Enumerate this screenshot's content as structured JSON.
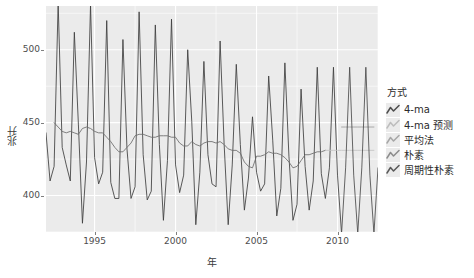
{
  "chart_data": {
    "type": "line",
    "title": "",
    "xlabel": "年",
    "ylabel": "兆升",
    "xlim": [
      1992.0,
      2012.5
    ],
    "ylim": [
      375,
      530
    ],
    "xticks": [
      1995,
      2000,
      2005,
      2010
    ],
    "yticks": [
      400,
      450,
      500
    ],
    "grid": true,
    "legend": {
      "title": "方式",
      "position": "right",
      "entries": [
        {
          "label": "4-ma",
          "color": "#4d4d4d"
        },
        {
          "label": "4-ma 预测",
          "color": "#bdbdbd"
        },
        {
          "label": "平均法",
          "color": "#a6a6a6"
        },
        {
          "label": "朴素",
          "color": "#8c8c8c"
        },
        {
          "label": "周期性朴素",
          "color": "#595959"
        }
      ]
    },
    "series": [
      {
        "name": "观测值",
        "color": "#3d3d3d",
        "type": "line",
        "points": [
          [
            1992.0,
            443
          ],
          [
            1992.25,
            410
          ],
          [
            1992.5,
            420
          ],
          [
            1992.75,
            532
          ],
          [
            1993.0,
            433
          ],
          [
            1993.25,
            421
          ],
          [
            1993.5,
            410
          ],
          [
            1993.75,
            512
          ],
          [
            1994.0,
            449
          ],
          [
            1994.25,
            381
          ],
          [
            1994.5,
            423
          ],
          [
            1994.75,
            531
          ],
          [
            1995.0,
            426
          ],
          [
            1995.25,
            408
          ],
          [
            1995.5,
            416
          ],
          [
            1995.75,
            520
          ],
          [
            1996.0,
            409
          ],
          [
            1996.25,
            398
          ],
          [
            1996.5,
            398
          ],
          [
            1996.75,
            507
          ],
          [
            1997.0,
            432
          ],
          [
            1997.25,
            398
          ],
          [
            1997.5,
            406
          ],
          [
            1997.75,
            526
          ],
          [
            1998.0,
            428
          ],
          [
            1998.25,
            397
          ],
          [
            1998.5,
            403
          ],
          [
            1998.75,
            517
          ],
          [
            1999.0,
            435
          ],
          [
            1999.25,
            383
          ],
          [
            1999.5,
            424
          ],
          [
            1999.75,
            521
          ],
          [
            2000.0,
            421
          ],
          [
            2000.25,
            402
          ],
          [
            2000.5,
            414
          ],
          [
            2000.75,
            500
          ],
          [
            2001.0,
            451
          ],
          [
            2001.25,
            380
          ],
          [
            2001.5,
            416
          ],
          [
            2001.75,
            492
          ],
          [
            2002.0,
            428
          ],
          [
            2002.25,
            408
          ],
          [
            2002.5,
            406
          ],
          [
            2002.75,
            506
          ],
          [
            2003.0,
            435
          ],
          [
            2003.25,
            380
          ],
          [
            2003.5,
            421
          ],
          [
            2003.75,
            490
          ],
          [
            2004.0,
            435
          ],
          [
            2004.25,
            390
          ],
          [
            2004.5,
            412
          ],
          [
            2004.75,
            454
          ],
          [
            2005.0,
            416
          ],
          [
            2005.25,
            403
          ],
          [
            2005.5,
            408
          ],
          [
            2005.75,
            482
          ],
          [
            2006.0,
            438
          ],
          [
            2006.25,
            386
          ],
          [
            2006.5,
            405
          ],
          [
            2006.75,
            491
          ],
          [
            2007.0,
            427
          ],
          [
            2007.25,
            383
          ],
          [
            2007.5,
            394
          ],
          [
            2007.75,
            473
          ],
          [
            2008.0,
            420
          ],
          [
            2008.25,
            390
          ],
          [
            2008.5,
            410
          ],
          [
            2008.75,
            488
          ],
          [
            2009.0,
            415
          ],
          [
            2009.25,
            398
          ],
          [
            2009.5,
            419
          ],
          [
            2009.75,
            488
          ],
          [
            2010.0,
            414
          ],
          [
            2010.25,
            374
          ]
        ]
      },
      {
        "name": "4-ma",
        "color": "#6b6b6b",
        "type": "line",
        "points": [
          [
            1992.5,
            450
          ],
          [
            1992.75,
            447
          ],
          [
            1993.0,
            444
          ],
          [
            1993.25,
            443
          ],
          [
            1993.5,
            444
          ],
          [
            1993.75,
            443
          ],
          [
            1994.0,
            442
          ],
          [
            1994.25,
            446
          ],
          [
            1994.5,
            447
          ],
          [
            1994.75,
            446
          ],
          [
            1995.0,
            444
          ],
          [
            1995.25,
            443
          ],
          [
            1995.5,
            443
          ],
          [
            1995.75,
            440
          ],
          [
            1996.0,
            437
          ],
          [
            1996.25,
            433
          ],
          [
            1996.5,
            430
          ],
          [
            1996.75,
            430
          ],
          [
            1997.0,
            433
          ],
          [
            1997.25,
            436
          ],
          [
            1997.5,
            441
          ],
          [
            1997.75,
            442
          ],
          [
            1998.0,
            442
          ],
          [
            1998.25,
            441
          ],
          [
            1998.5,
            440
          ],
          [
            1998.75,
            440
          ],
          [
            1999.0,
            441
          ],
          [
            1999.25,
            441
          ],
          [
            1999.5,
            441
          ],
          [
            1999.75,
            440
          ],
          [
            2000.0,
            440
          ],
          [
            2000.25,
            436
          ],
          [
            2000.5,
            434
          ],
          [
            2000.75,
            434
          ],
          [
            2001.0,
            437
          ],
          [
            2001.25,
            435
          ],
          [
            2001.5,
            434
          ],
          [
            2001.75,
            436
          ],
          [
            2002.0,
            437
          ],
          [
            2002.25,
            437
          ],
          [
            2002.5,
            436
          ],
          [
            2002.75,
            437
          ],
          [
            2003.0,
            435
          ],
          [
            2003.25,
            432
          ],
          [
            2003.5,
            431
          ],
          [
            2003.75,
            431
          ],
          [
            2004.0,
            429
          ],
          [
            2004.25,
            423
          ],
          [
            2004.5,
            420
          ],
          [
            2004.75,
            419
          ],
          [
            2005.0,
            427
          ],
          [
            2005.25,
            427
          ],
          [
            2005.5,
            428
          ],
          [
            2005.75,
            430
          ],
          [
            2006.0,
            429
          ],
          [
            2006.25,
            429
          ],
          [
            2006.5,
            428
          ],
          [
            2006.75,
            426
          ],
          [
            2007.0,
            423
          ],
          [
            2007.25,
            419
          ],
          [
            2007.5,
            420
          ],
          [
            2007.75,
            424
          ],
          [
            2008.0,
            428
          ],
          [
            2008.25,
            428
          ],
          [
            2008.5,
            429
          ],
          [
            2008.75,
            430
          ],
          [
            2009.0,
            430
          ],
          [
            2009.25,
            431
          ]
        ]
      },
      {
        "name": "4-ma 预测",
        "color": "#c4c4c4",
        "type": "line",
        "points": [
          [
            2009.25,
            431
          ],
          [
            2009.5,
            431
          ],
          [
            2009.75,
            431
          ],
          [
            2010.0,
            431
          ],
          [
            2010.25,
            431
          ],
          [
            2010.5,
            431
          ],
          [
            2010.75,
            431
          ],
          [
            2011.0,
            431
          ],
          [
            2011.25,
            431
          ],
          [
            2011.5,
            431
          ],
          [
            2011.75,
            431
          ],
          [
            2012.0,
            431
          ],
          [
            2012.25,
            431
          ]
        ]
      },
      {
        "name": "平均法",
        "color": "#9e9e9e",
        "type": "line",
        "points": [
          [
            2010.25,
            447
          ],
          [
            2010.5,
            447
          ],
          [
            2010.75,
            447
          ],
          [
            2011.0,
            447
          ],
          [
            2011.25,
            447
          ],
          [
            2011.5,
            447
          ],
          [
            2011.75,
            447
          ],
          [
            2012.0,
            447
          ],
          [
            2012.25,
            447
          ]
        ]
      },
      {
        "name": "朴素",
        "color": "#858585",
        "type": "line",
        "points": [
          [
            2010.25,
            374
          ],
          [
            2010.5,
            374
          ],
          [
            2010.75,
            374
          ],
          [
            2011.0,
            374
          ],
          [
            2011.25,
            374
          ],
          [
            2011.5,
            374
          ],
          [
            2011.75,
            374
          ],
          [
            2012.0,
            374
          ],
          [
            2012.25,
            374
          ]
        ]
      },
      {
        "name": "周期性朴素",
        "color": "#4a4a4a",
        "type": "line",
        "points": [
          [
            2010.25,
            374
          ],
          [
            2010.5,
            419
          ],
          [
            2010.75,
            488
          ],
          [
            2011.0,
            414
          ],
          [
            2011.25,
            374
          ],
          [
            2011.5,
            419
          ],
          [
            2011.75,
            488
          ],
          [
            2012.0,
            414
          ],
          [
            2012.25,
            374
          ],
          [
            2012.5,
            419
          ]
        ]
      }
    ]
  }
}
